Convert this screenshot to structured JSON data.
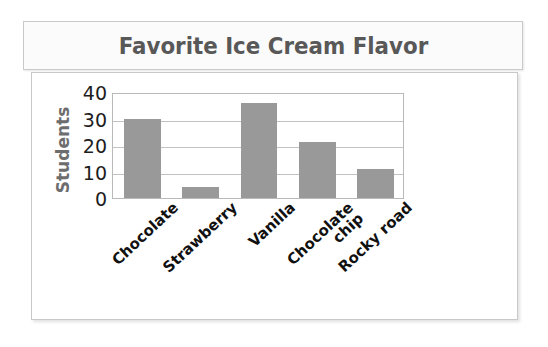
{
  "chart_data": {
    "type": "bar",
    "title": "Favorite Ice Cream Flavor",
    "xlabel": "",
    "ylabel": "Students",
    "categories": [
      "Chocolate",
      "Strawberry",
      "Vanilla",
      "Chocolate\nchip",
      "Rocky road"
    ],
    "values": [
      30,
      4,
      36,
      21,
      11
    ],
    "ylim": [
      0,
      40
    ],
    "yticks": [
      0,
      10,
      20,
      30,
      40
    ],
    "ytick_labels": [
      "0",
      "10",
      "20",
      "30",
      "40"
    ],
    "grid": true,
    "legend": "none",
    "bar_color": "#999999",
    "title_color": "#585858",
    "axis_label_color": "#6d6d6d",
    "tick_label_color": "#1d1d1d",
    "frame_color": "#c9c9c9"
  }
}
